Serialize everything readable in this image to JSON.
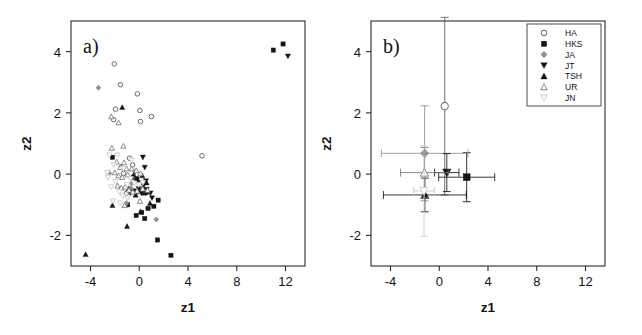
{
  "figure": {
    "width": 642,
    "height": 335,
    "background": "#ffffff",
    "panels": [
      {
        "id": "a",
        "label": "a)"
      },
      {
        "id": "b",
        "label": "b)"
      }
    ]
  },
  "axes": {
    "xlabel": "z1",
    "ylabel": "z2",
    "xticks": [
      -4,
      0,
      4,
      8,
      12
    ],
    "xticklabels": [
      "-4",
      "0",
      "4",
      "8",
      "12"
    ],
    "yticks": [
      -2,
      0,
      2,
      4
    ],
    "yticklabels": [
      "-2",
      "0",
      "2",
      "4"
    ],
    "xlim": [
      -5.6,
      13.6
    ],
    "ylim": [
      -3.0,
      5.0
    ]
  },
  "legend": {
    "position": "top-right-panel-b",
    "entries": [
      {
        "label": "HA",
        "marker": "open-circle",
        "color": "#5a5a5a"
      },
      {
        "label": "HKS",
        "marker": "filled-square",
        "color": "#151515"
      },
      {
        "label": "JA",
        "marker": "filled-diamond",
        "color": "#8f8f8f"
      },
      {
        "label": "JT",
        "marker": "filled-triangle-down",
        "color": "#151515"
      },
      {
        "label": "TSH",
        "marker": "filled-triangle-up",
        "color": "#151515"
      },
      {
        "label": "UR",
        "marker": "open-triangle-up",
        "color": "#777777"
      },
      {
        "label": "JN",
        "marker": "open-triangle-down",
        "color": "#c6c6c6"
      }
    ]
  },
  "chart_data": [
    {
      "type": "scatter",
      "panel": "a",
      "title": "a)",
      "xlabel": "z1",
      "ylabel": "z2",
      "xlim": [
        -5.6,
        13.6
      ],
      "ylim": [
        -3.0,
        5.0
      ],
      "grid": false,
      "legend": false,
      "series": [
        {
          "name": "HA",
          "marker": "open-circle",
          "color": "#5a5a5a",
          "points": [
            [
              -2.05,
              3.6
            ],
            [
              -1.55,
              2.92
            ],
            [
              -0.15,
              2.62
            ],
            [
              0.05,
              2.08
            ],
            [
              0.1,
              1.72
            ],
            [
              1.0,
              1.88
            ],
            [
              -1.95,
              2.12
            ],
            [
              -2.1,
              1.78
            ],
            [
              5.15,
              0.6
            ],
            [
              -0.55,
              0.3
            ],
            [
              -1.3,
              0.02
            ],
            [
              -1.05,
              -0.62
            ],
            [
              -0.8,
              0.52
            ]
          ]
        },
        {
          "name": "HKS",
          "marker": "filled-square",
          "color": "#151515",
          "points": [
            [
              11.0,
              4.05
            ],
            [
              11.8,
              4.25
            ],
            [
              -2.2,
              0.55
            ],
            [
              1.55,
              -0.85
            ],
            [
              1.2,
              -1.05
            ],
            [
              0.2,
              -1.25
            ],
            [
              -0.25,
              -1.35
            ],
            [
              0.45,
              -1.45
            ],
            [
              1.5,
              -2.15
            ],
            [
              2.6,
              -2.65
            ],
            [
              -0.95,
              -1.0
            ],
            [
              0.72,
              -1.12
            ],
            [
              -0.45,
              -0.55
            ],
            [
              -0.2,
              -0.15
            ],
            [
              0.6,
              -0.6
            ],
            [
              0.3,
              -0.5
            ]
          ]
        },
        {
          "name": "JA",
          "marker": "filled-diamond",
          "color": "#8f8f8f",
          "points": [
            [
              -3.35,
              2.82
            ],
            [
              1.4,
              -1.48
            ],
            [
              -2.45,
              0.02
            ],
            [
              -1.05,
              -0.95
            ],
            [
              -0.35,
              0.08
            ],
            [
              -0.7,
              -0.45
            ],
            [
              -1.5,
              0.25
            ],
            [
              0.15,
              -0.55
            ],
            [
              -0.62,
              -0.3
            ]
          ]
        },
        {
          "name": "JT",
          "marker": "filled-triangle-down",
          "color": "#151515",
          "points": [
            [
              12.2,
              3.85
            ],
            [
              0.3,
              0.55
            ],
            [
              0.45,
              0.22
            ],
            [
              0.55,
              -0.22
            ],
            [
              -0.1,
              -0.58
            ],
            [
              -0.4,
              -0.6
            ],
            [
              -0.72,
              -0.62
            ],
            [
              0.18,
              -0.62
            ],
            [
              0.92,
              -0.62
            ],
            [
              1.05,
              -0.78
            ],
            [
              0.62,
              -0.5
            ],
            [
              -0.05,
              -0.48
            ],
            [
              0.35,
              -0.38
            ],
            [
              -0.25,
              -0.62
            ]
          ]
        },
        {
          "name": "TSH",
          "marker": "filled-triangle-up",
          "color": "#151515",
          "points": [
            [
              -4.4,
              -2.62
            ],
            [
              -1.4,
              2.18
            ],
            [
              -2.2,
              -1.02
            ],
            [
              -1.0,
              -1.7
            ],
            [
              -0.6,
              -0.1
            ],
            [
              -0.45,
              -0.02
            ],
            [
              -0.1,
              -0.2
            ],
            [
              0.25,
              -0.05
            ],
            [
              0.6,
              -0.28
            ],
            [
              -0.88,
              -0.48
            ],
            [
              0.05,
              -0.55
            ],
            [
              0.42,
              -0.62
            ],
            [
              -0.3,
              -0.68
            ],
            [
              0.88,
              -0.95
            ],
            [
              0.12,
              -1.22
            ]
          ]
        },
        {
          "name": "UR",
          "marker": "open-triangle-up",
          "color": "#777777",
          "points": [
            [
              -2.25,
              0.85
            ],
            [
              -1.3,
              0.92
            ],
            [
              -1.85,
              0.4
            ],
            [
              -1.55,
              0.22
            ],
            [
              -1.25,
              0.38
            ],
            [
              -1.05,
              0.18
            ],
            [
              -2.0,
              0.05
            ],
            [
              -1.7,
              -0.05
            ],
            [
              -1.4,
              -0.1
            ],
            [
              -0.95,
              -0.02
            ],
            [
              -0.62,
              0.18
            ],
            [
              -0.25,
              0.12
            ],
            [
              0.1,
              0.02
            ],
            [
              -1.78,
              -0.38
            ],
            [
              -1.48,
              -0.45
            ],
            [
              -1.15,
              -0.42
            ],
            [
              -0.85,
              -0.52
            ],
            [
              -0.52,
              -0.58
            ],
            [
              -0.18,
              -0.55
            ],
            [
              0.28,
              -0.48
            ],
            [
              0.68,
              -0.52
            ],
            [
              -1.2,
              -1.02
            ],
            [
              0.05,
              -0.88
            ],
            [
              -2.3,
              1.88
            ],
            [
              -1.7,
              1.68
            ]
          ]
        },
        {
          "name": "JN",
          "marker": "open-triangle-down",
          "color": "#c6c6c6",
          "points": [
            [
              -2.45,
              0.62
            ],
            [
              -2.1,
              0.3
            ],
            [
              -1.8,
              0.62
            ],
            [
              -2.55,
              -0.1
            ],
            [
              -2.3,
              -0.42
            ],
            [
              -1.95,
              -0.25
            ],
            [
              -1.62,
              -0.58
            ],
            [
              -1.35,
              -0.72
            ],
            [
              -1.0,
              -0.35
            ],
            [
              -0.7,
              -0.15
            ],
            [
              -0.4,
              -0.3
            ],
            [
              -0.05,
              -0.35
            ],
            [
              0.3,
              -0.28
            ],
            [
              -2.15,
              -0.88
            ],
            [
              -1.55,
              -0.95
            ],
            [
              -0.95,
              -0.78
            ],
            [
              -1.3,
              0.18
            ],
            [
              -0.62,
              0.45
            ],
            [
              -2.62,
              0.05
            ]
          ]
        }
      ]
    },
    {
      "type": "scatter",
      "panel": "b",
      "title": "b)",
      "xlabel": "z1",
      "ylabel": "z2",
      "xlim": [
        -5.6,
        13.6
      ],
      "ylim": [
        -3.0,
        5.0
      ],
      "grid": false,
      "legend": true,
      "description": "Group means with horizontal (z1) and vertical (z2) error bars",
      "means": [
        {
          "name": "HA",
          "marker": "open-circle",
          "color": "#5a5a5a",
          "x": 0.45,
          "y": 2.22,
          "xerr": 0.1,
          "yerr": 2.9
        },
        {
          "name": "HKS",
          "marker": "filled-square",
          "color": "#151515",
          "x": 2.25,
          "y": -0.1,
          "xerr": 2.3,
          "yerr": 0.8
        },
        {
          "name": "JA",
          "marker": "filled-diamond",
          "color": "#8f8f8f",
          "x": -1.2,
          "y": 0.68,
          "xerr": 3.55,
          "yerr": 1.55
        },
        {
          "name": "JT",
          "marker": "filled-triangle-down",
          "color": "#151515",
          "x": 0.62,
          "y": 0.05,
          "xerr": 1.0,
          "yerr": 0.62
        },
        {
          "name": "TSH",
          "marker": "filled-triangle-up",
          "color": "#151515",
          "x": -1.18,
          "y": -0.68,
          "xerr": 3.4,
          "yerr": 0.55
        },
        {
          "name": "UR",
          "marker": "open-triangle-up",
          "color": "#777777",
          "x": -1.22,
          "y": 0.05,
          "xerr": 1.95,
          "yerr": 0.82
        },
        {
          "name": "JN",
          "marker": "open-triangle-down",
          "color": "#c6c6c6",
          "x": -1.25,
          "y": -0.55,
          "xerr": 0.85,
          "yerr": 1.48
        }
      ]
    }
  ]
}
